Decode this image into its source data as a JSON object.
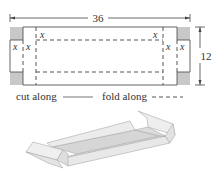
{
  "diagram": {
    "dimensions": {
      "length_label": "36",
      "width_label": "12"
    },
    "variable_label": "x",
    "legend": {
      "cut_label": "cut along",
      "fold_label": "fold along"
    },
    "colors": {
      "cut_line": "#555555",
      "fold_line": "#444444",
      "corner_fill": "#c8c8c8",
      "box_fill": "#e6e6e6"
    },
    "figures": [
      {
        "name": "flat-net",
        "description": "36 by 12 rectangle with x by x squares cut from each corner, fold lines dashed"
      },
      {
        "name": "folded-box",
        "description": "3D open box formed by folding the net"
      }
    ]
  }
}
